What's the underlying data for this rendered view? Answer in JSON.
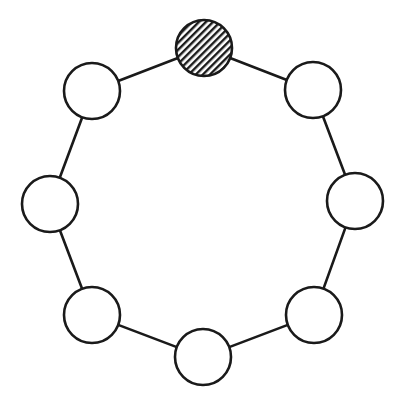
{
  "diagram": {
    "type": "ring-graph",
    "node_count": 8,
    "node_radius": 28,
    "stroke_color": "#1a1a1a",
    "stroke_width": 2.6,
    "fill_color": "#ffffff",
    "hatch_color": "#1a1a1a",
    "nodes": [
      {
        "id": "top",
        "cx": 204,
        "cy": 48,
        "highlighted": true,
        "fill": "hatched"
      },
      {
        "id": "upper-right",
        "cx": 313,
        "cy": 90,
        "highlighted": false,
        "fill": "empty"
      },
      {
        "id": "right",
        "cx": 355,
        "cy": 201,
        "highlighted": false,
        "fill": "empty"
      },
      {
        "id": "lower-right",
        "cx": 314,
        "cy": 315,
        "highlighted": false,
        "fill": "empty"
      },
      {
        "id": "bottom",
        "cx": 203,
        "cy": 357,
        "highlighted": false,
        "fill": "empty"
      },
      {
        "id": "lower-left",
        "cx": 92,
        "cy": 315,
        "highlighted": false,
        "fill": "empty"
      },
      {
        "id": "left",
        "cx": 50,
        "cy": 204,
        "highlighted": false,
        "fill": "empty"
      },
      {
        "id": "upper-left",
        "cx": 92,
        "cy": 91,
        "highlighted": false,
        "fill": "empty"
      }
    ],
    "edges": [
      [
        "top",
        "upper-right"
      ],
      [
        "upper-right",
        "right"
      ],
      [
        "right",
        "lower-right"
      ],
      [
        "lower-right",
        "bottom"
      ],
      [
        "bottom",
        "lower-left"
      ],
      [
        "lower-left",
        "left"
      ],
      [
        "left",
        "upper-left"
      ],
      [
        "upper-left",
        "top"
      ]
    ]
  }
}
